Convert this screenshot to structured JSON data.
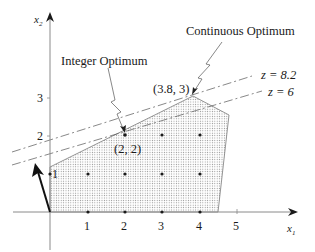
{
  "diagram": {
    "type": "integer-programming-feasible-region",
    "axes": {
      "x_label": "x",
      "x_sub": "1",
      "y_label": "x",
      "y_sub": "2",
      "x_ticks": [
        "1",
        "2",
        "3",
        "4",
        "5"
      ],
      "y_ticks": [
        "1",
        "2",
        "3"
      ]
    },
    "annotations": {
      "integer_optimum": "Integer Optimum",
      "continuous_optimum": "Continuous Optimum",
      "integer_point": "(2, 2)",
      "continuous_point": "(3.8, 3)",
      "objective_high": "z = 8.2",
      "objective_low": "z = 6"
    },
    "feasible_region_vertices": [
      [
        0,
        0
      ],
      [
        0,
        1.15
      ],
      [
        3.8,
        3
      ],
      [
        4.7,
        2.55
      ],
      [
        4.45,
        0
      ]
    ],
    "integer_points": [
      [
        0,
        1
      ],
      [
        1,
        1
      ],
      [
        2,
        1
      ],
      [
        3,
        1
      ],
      [
        4,
        1
      ],
      [
        2,
        2
      ],
      [
        3,
        2
      ],
      [
        4,
        2
      ],
      [
        1,
        0
      ],
      [
        2,
        0
      ],
      [
        3,
        0
      ],
      [
        4,
        0
      ]
    ],
    "gradient_vector": {
      "from": [
        0,
        0
      ],
      "to": [
        -0.38,
        1.2
      ]
    },
    "colors": {
      "ink": "#1a1a1a",
      "axis": "#8a8a8a",
      "region_dots": "#9a9a9a",
      "region_edge": "#7a7a7a"
    }
  }
}
